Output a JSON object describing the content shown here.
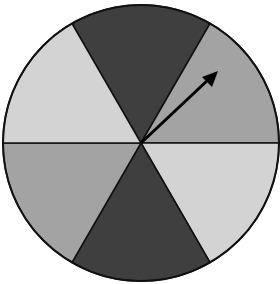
{
  "diagram": {
    "type": "spinner",
    "sector_count": 6,
    "sectors": [
      {
        "name": "top",
        "shade": "dark",
        "color": "#3f3f3f"
      },
      {
        "name": "upper-right",
        "shade": "medium",
        "color": "#a3a3a3"
      },
      {
        "name": "lower-right",
        "shade": "light",
        "color": "#d3d3d3"
      },
      {
        "name": "bottom",
        "shade": "dark",
        "color": "#3f3f3f"
      },
      {
        "name": "lower-left",
        "shade": "medium",
        "color": "#a3a3a3"
      },
      {
        "name": "upper-left",
        "shade": "light",
        "color": "#d3d3d3"
      }
    ],
    "arrow": {
      "points_to": "upper-right",
      "color": "#000000"
    }
  }
}
